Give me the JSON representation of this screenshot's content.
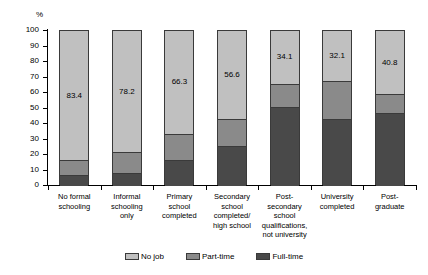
{
  "chart_data": {
    "type": "bar",
    "subtype": "stacked-bar-100",
    "title": "",
    "xlabel": "",
    "ylabel": "%",
    "ylim": [
      0,
      100
    ],
    "yticks": [
      0,
      10,
      20,
      30,
      40,
      50,
      60,
      70,
      80,
      90,
      100
    ],
    "grid": false,
    "legend_position": "bottom",
    "categories": [
      "No formal schooling",
      "Informal schooling only",
      "Primary school completed",
      "Secondary school completed/ high school",
      "Post-secondary school qualifications, not university",
      "University completed",
      "Post-graduate"
    ],
    "category_lines": [
      [
        "No formal",
        "schooling"
      ],
      [
        "Informal",
        "schooling",
        "only"
      ],
      [
        "Primary",
        "school",
        "completed"
      ],
      [
        "Secondary",
        "school",
        "completed/",
        "high school"
      ],
      [
        "Post-",
        "secondary",
        "school",
        "qualifications,",
        "not university"
      ],
      [
        "University",
        "completed"
      ],
      [
        "Post-",
        "graduate"
      ]
    ],
    "series": [
      {
        "name": "Full-time",
        "color": "#494949",
        "values": [
          7.0,
          8.5,
          16.5,
          26.0,
          51.0,
          43.0,
          47.0
        ],
        "labels": [
          "",
          "",
          "",
          "",
          "",
          "",
          ""
        ]
      },
      {
        "name": "Part-time",
        "color": "#8a8a8a",
        "values": [
          9.6,
          13.3,
          17.2,
          17.4,
          14.9,
          24.9,
          12.2
        ],
        "labels": [
          "",
          "",
          "",
          "",
          "",
          "",
          ""
        ]
      },
      {
        "name": "No job",
        "color": "#c0c0c0",
        "values": [
          83.4,
          78.2,
          66.3,
          56.6,
          34.1,
          32.1,
          40.8
        ],
        "labels": [
          "83.4",
          "78.2",
          "66.3",
          "56.6",
          "34.1",
          "32.1",
          "40.8"
        ]
      }
    ]
  },
  "legend": {
    "items": [
      {
        "label": "No job",
        "color": "#c0c0c0"
      },
      {
        "label": "Part-time",
        "color": "#8a8a8a"
      },
      {
        "label": "Full-time",
        "color": "#494949"
      }
    ]
  }
}
